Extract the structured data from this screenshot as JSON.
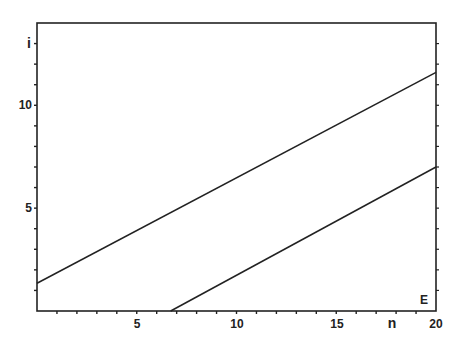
{
  "chart_data": {
    "type": "line",
    "title": "",
    "xlabel": "n",
    "ylabel": "i",
    "corner_label": "E",
    "xlim": [
      0,
      20
    ],
    "ylim": [
      0,
      14
    ],
    "x_ticks_labeled": [
      5,
      10,
      15,
      20
    ],
    "y_ticks_labeled": [
      5,
      10
    ],
    "x_minor_tick_step": 1,
    "y_minor_tick_step": 1,
    "grid": false,
    "legend": null,
    "series": [
      {
        "name": "upper line",
        "x": [
          0,
          20
        ],
        "y": [
          1.35,
          11.6
        ]
      },
      {
        "name": "lower line",
        "x": [
          6.7,
          20
        ],
        "y": [
          0,
          7.0
        ]
      }
    ]
  },
  "labels": {
    "y_axis": "i",
    "x_axis": "n",
    "corner": "E",
    "x5": "5",
    "x10": "10",
    "x15": "15",
    "x20": "20",
    "y5": "5",
    "y10": "10"
  }
}
